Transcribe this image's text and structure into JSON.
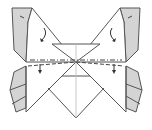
{
  "diagram": {
    "type": "origami-fold-step",
    "colors": {
      "paper": "#ffffff",
      "shaded_flap": "#d4d4d4",
      "line": "#555555",
      "crease": "#bbbbbb"
    },
    "elements": {
      "left_top_flap": "shaded",
      "right_top_flap": "shaded",
      "left_bottom_flap": "shaded",
      "right_bottom_flap": "shaded",
      "center_x_crease": "crease",
      "horizontal_fold_line": "dash-dot valley fold",
      "arrows": [
        "fold-down-left-upper",
        "fold-down-right-upper",
        "fold-down-left-lower",
        "fold-down-right-lower"
      ]
    }
  }
}
